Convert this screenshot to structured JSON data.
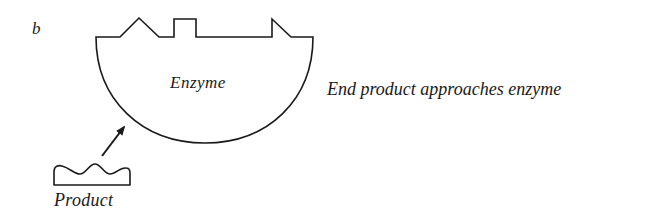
{
  "figure": {
    "panel_label": "b",
    "enzyme": {
      "label": "Enzyme",
      "features": [
        "triangular-site",
        "rectangular-site",
        "notch-site"
      ]
    },
    "product": {
      "label": "Product",
      "shape": "wavy-top"
    },
    "arrow": {
      "direction": "product-to-enzyme"
    },
    "caption": "End product approaches enzyme",
    "colors": {
      "stroke": "#1a1a1a",
      "background": "#ffffff"
    }
  }
}
